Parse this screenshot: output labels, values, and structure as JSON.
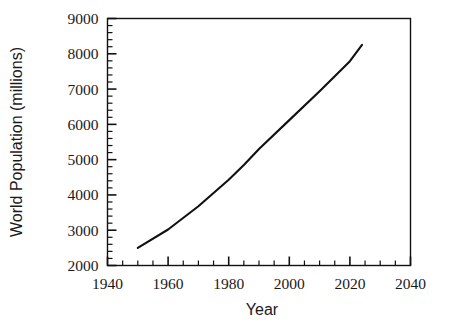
{
  "chart_data": {
    "type": "line",
    "title": "",
    "xlabel": "Year",
    "ylabel": "World Population (millions)",
    "xlim": [
      1940,
      2040
    ],
    "ylim": [
      2000,
      9000
    ],
    "x_major_ticks": [
      1940,
      1960,
      1980,
      2000,
      2020,
      2040
    ],
    "x_tick_labels": [
      "1940",
      "1960",
      "1980",
      "2000",
      "2020",
      "2040"
    ],
    "x_minor_step": 5,
    "y_major_ticks": [
      2000,
      3000,
      4000,
      5000,
      6000,
      7000,
      8000,
      9000
    ],
    "y_tick_labels": [
      "2000",
      "3000",
      "4000",
      "5000",
      "6000",
      "7000",
      "8000",
      "9000"
    ],
    "y_minor_step": 200,
    "grid": false,
    "legend": false,
    "series": [
      {
        "name": "World Population",
        "color": "#111111",
        "x": [
          1950,
          1960,
          1970,
          1980,
          1985,
          1990,
          2000,
          2010,
          2020,
          2024
        ],
        "y": [
          2500,
          3020,
          3680,
          4430,
          4850,
          5300,
          6120,
          6940,
          7790,
          8250
        ]
      }
    ],
    "annotations": []
  },
  "axes": {
    "frame_color": "#111111",
    "tick_color": "#111111",
    "background": "#ffffff"
  }
}
